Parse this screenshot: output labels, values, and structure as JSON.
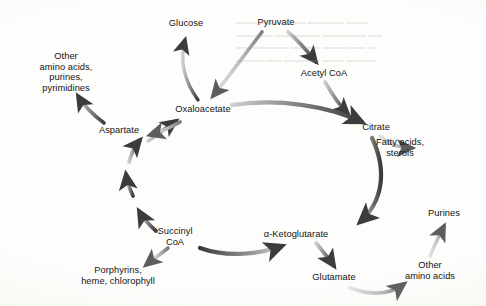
{
  "figure": {
    "type": "cycle-diagram",
    "background_color": "#fdfdfb",
    "arrow_color_dark": "#3f3f3f",
    "arrow_color_light": "#c9c9c9",
    "text_color": "#141414"
  },
  "nodes": [
    {
      "id": "glucose",
      "label": "Glucose",
      "x": 186,
      "y": 23,
      "lines": 1
    },
    {
      "id": "pyruvate",
      "label": "Pyruvate",
      "x": 276,
      "y": 22,
      "lines": 1
    },
    {
      "id": "acetyl_coa",
      "label": "Acetyl CoA",
      "x": 324,
      "y": 73,
      "lines": 1
    },
    {
      "id": "other_aa_pur",
      "label": "Other\namino acids,\npurines,\npyrimidines",
      "x": 66,
      "y": 72,
      "lines": 4
    },
    {
      "id": "oxaloacetate",
      "label": "Oxaloacetate",
      "x": 203,
      "y": 109,
      "lines": 1
    },
    {
      "id": "citrate",
      "label": "Citrate",
      "x": 376,
      "y": 127,
      "lines": 1
    },
    {
      "id": "aspartate",
      "label": "Aspartate",
      "x": 119,
      "y": 130,
      "lines": 1
    },
    {
      "id": "fatty_acids",
      "label": "Fatty acids,\nsterols",
      "x": 400,
      "y": 148,
      "lines": 2
    },
    {
      "id": "succinyl_coa",
      "label": "Succinyl\nCoA",
      "x": 175,
      "y": 237,
      "lines": 2
    },
    {
      "id": "a_ketoglut",
      "label": "α-Ketoglutarate",
      "x": 296,
      "y": 234,
      "lines": 1
    },
    {
      "id": "purines",
      "label": "Purines",
      "x": 444,
      "y": 213,
      "lines": 1
    },
    {
      "id": "porphyrins",
      "label": "Porphyrins,\nheme, chlorophyll",
      "x": 118,
      "y": 276,
      "lines": 2
    },
    {
      "id": "glutamate",
      "label": "Glutamate",
      "x": 334,
      "y": 277,
      "lines": 1
    },
    {
      "id": "other_aa",
      "label": "Other\namino acids",
      "x": 430,
      "y": 271,
      "lines": 2
    }
  ],
  "edges": [
    {
      "id": "oxaloacetate-to-glucose",
      "from": "oxaloacetate",
      "to": "glucose",
      "shade": "dark"
    },
    {
      "id": "pyruvate-to-oxaloacetate",
      "from": "pyruvate",
      "to": "oxaloacetate",
      "shade": "light"
    },
    {
      "id": "pyruvate-to-acetyl-coa",
      "from": "pyruvate",
      "to": "acetyl_coa",
      "shade": "dark"
    },
    {
      "id": "acetyl-coa-to-citrate",
      "from": "acetyl_coa",
      "to": "citrate",
      "shade": "dark"
    },
    {
      "id": "oxaloacetate-to-citrate",
      "from": "oxaloacetate",
      "to": "citrate",
      "shade": "dark"
    },
    {
      "id": "citrate-to-fatty-acids",
      "from": "citrate",
      "to": "fatty_acids",
      "shade": "light"
    },
    {
      "id": "citrate-to-alpha-ketoglutarate",
      "from": "citrate",
      "to": "a_ketoglut",
      "shade": "dark"
    },
    {
      "id": "alpha-ketoglutarate-to-glutamate",
      "from": "a_ketoglut",
      "to": "glutamate",
      "shade": "dark"
    },
    {
      "id": "glutamate-to-other-amino-acids",
      "from": "glutamate",
      "to": "other_aa",
      "shade": "light"
    },
    {
      "id": "other-amino-acids-to-purines",
      "from": "other_aa",
      "to": "purines",
      "shade": "light"
    },
    {
      "id": "alpha-ketoglutarate-to-succinyl-coa",
      "from": "a_ketoglut",
      "to": "succinyl_coa",
      "shade": "dark"
    },
    {
      "id": "succinyl-coa-to-porphyrins",
      "from": "succinyl_coa",
      "to": "porphyrins",
      "shade": "light"
    },
    {
      "id": "succinyl-coa-arc-1",
      "from": "succinyl_coa",
      "to": "cycle-left",
      "shade": "dark"
    },
    {
      "id": "cycle-arc-2",
      "from": "cycle-left",
      "to": "cycle-left",
      "shade": "dark"
    },
    {
      "id": "cycle-arc-3",
      "from": "cycle-left",
      "to": "oxaloacetate",
      "shade": "dark"
    },
    {
      "id": "aspartate-to-oxaloacetate",
      "from": "aspartate",
      "to": "oxaloacetate",
      "shade": "dark"
    },
    {
      "id": "oxaloacetate-to-aspartate",
      "from": "oxaloacetate",
      "to": "aspartate",
      "shade": "dark"
    },
    {
      "id": "aspartate-to-other-amino-acids",
      "from": "aspartate",
      "to": "other_aa_pur",
      "shade": "dark"
    }
  ]
}
